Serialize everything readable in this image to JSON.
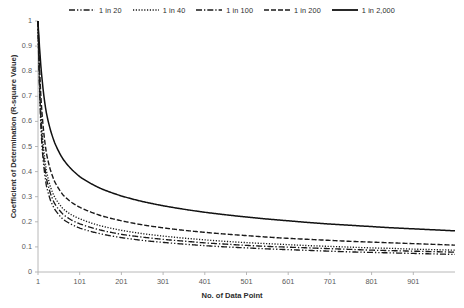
{
  "chart_data": {
    "type": "line",
    "title": "",
    "xlabel": "No. of Data Point",
    "ylabel": "Coefficient of Determination (R-square Value)",
    "xlim": [
      1,
      1001
    ],
    "ylim": [
      0,
      1
    ],
    "xticks": [
      "1",
      "101",
      "201",
      "301",
      "401",
      "501",
      "601",
      "701",
      "801",
      "901"
    ],
    "xtick_values": [
      1,
      101,
      201,
      301,
      401,
      501,
      601,
      701,
      801,
      901
    ],
    "yticks": [
      "0",
      "0.1",
      "0.2",
      "0.3",
      "0.4",
      "0.5",
      "0.6",
      "0.7",
      "0.8",
      "0.9",
      "1"
    ],
    "ytick_values": [
      0,
      0.1,
      0.2,
      0.3,
      0.4,
      0.5,
      0.6,
      0.7,
      0.8,
      0.9,
      1
    ],
    "grid": false,
    "legend_position": "top",
    "x": [
      1,
      3,
      6,
      11,
      21,
      31,
      41,
      61,
      81,
      101,
      151,
      201,
      251,
      301,
      351,
      401,
      451,
      501,
      551,
      601,
      651,
      701,
      751,
      801,
      851,
      901,
      951,
      1001
    ],
    "series": [
      {
        "name": "1 in 20",
        "dash": "dash-dot-dot",
        "color": "#1a1a1a",
        "values": [
          1.0,
          0.84,
          0.66,
          0.49,
          0.345,
          0.285,
          0.25,
          0.21,
          0.19,
          0.175,
          0.152,
          0.137,
          0.126,
          0.118,
          0.111,
          0.105,
          0.1,
          0.096,
          0.092,
          0.089,
          0.086,
          0.083,
          0.08,
          0.078,
          0.076,
          0.074,
          0.072,
          0.07
        ]
      },
      {
        "name": "1 in 40",
        "dash": "dotted",
        "color": "#1a1a1a",
        "values": [
          1.0,
          0.87,
          0.71,
          0.555,
          0.405,
          0.338,
          0.298,
          0.252,
          0.228,
          0.212,
          0.184,
          0.166,
          0.153,
          0.143,
          0.135,
          0.128,
          0.122,
          0.117,
          0.113,
          0.109,
          0.105,
          0.102,
          0.099,
          0.096,
          0.094,
          0.091,
          0.089,
          0.087
        ]
      },
      {
        "name": "1 in 100",
        "dash": "dash-dot",
        "color": "#1a1a1a",
        "values": [
          1.0,
          0.86,
          0.685,
          0.52,
          0.375,
          0.312,
          0.272,
          0.23,
          0.207,
          0.192,
          0.167,
          0.15,
          0.139,
          0.13,
          0.123,
          0.116,
          0.111,
          0.106,
          0.102,
          0.099,
          0.096,
          0.093,
          0.09,
          0.087,
          0.085,
          0.083,
          0.081,
          0.079
        ]
      },
      {
        "name": "1 in 200",
        "dash": "dashed",
        "color": "#1a1a1a",
        "values": [
          1.0,
          0.9,
          0.765,
          0.625,
          0.475,
          0.405,
          0.36,
          0.307,
          0.278,
          0.258,
          0.225,
          0.204,
          0.188,
          0.176,
          0.166,
          0.158,
          0.151,
          0.145,
          0.139,
          0.134,
          0.13,
          0.126,
          0.122,
          0.119,
          0.116,
          0.113,
          0.11,
          0.107
        ]
      },
      {
        "name": "1 in 2,000",
        "dash": "solid",
        "color": "#111111",
        "values": [
          1.0,
          0.945,
          0.865,
          0.765,
          0.635,
          0.565,
          0.515,
          0.45,
          0.41,
          0.38,
          0.333,
          0.303,
          0.281,
          0.264,
          0.25,
          0.238,
          0.228,
          0.219,
          0.211,
          0.204,
          0.197,
          0.191,
          0.186,
          0.181,
          0.176,
          0.172,
          0.168,
          0.164
        ]
      }
    ]
  },
  "axis": {
    "line_color": "#b0b0b0"
  }
}
